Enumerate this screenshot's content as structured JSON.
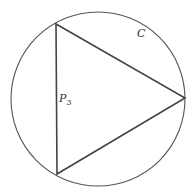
{
  "diagram": {
    "circle": {
      "label": "C",
      "cx": 98,
      "cy": 99,
      "r": 87,
      "stroke": "#555555"
    },
    "polygon": {
      "label_main": "P",
      "label_sub": "3",
      "vertices": [
        [
          56,
          24
        ],
        [
          185,
          98
        ],
        [
          57,
          174
        ]
      ],
      "stroke": "#444444"
    },
    "colors": {
      "background": "#ffffff",
      "ink": "#444444"
    }
  }
}
